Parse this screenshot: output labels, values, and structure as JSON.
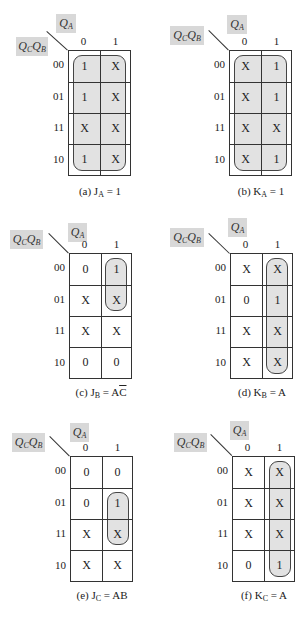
{
  "figure": {
    "col_var": "Q",
    "col_var_sub": "A",
    "row_var_1": "Q",
    "row_var_1_sub": "C",
    "row_var_2": "Q",
    "row_var_2_sub": "B",
    "col_headers": [
      "0",
      "1"
    ],
    "row_headers": [
      "00",
      "01",
      "11",
      "10"
    ]
  },
  "maps": [
    {
      "id": "a",
      "caption_prefix": "(a) J",
      "caption_sub": "A",
      "caption_eq": " = 1",
      "cells": [
        [
          "1",
          "X"
        ],
        [
          "1",
          "X"
        ],
        [
          "X",
          "X"
        ],
        [
          "1",
          "X"
        ]
      ],
      "group": {
        "col_start": 0,
        "col_end": 1,
        "row_start": 0,
        "row_end": 3
      }
    },
    {
      "id": "b",
      "caption_prefix": "(b) K",
      "caption_sub": "A",
      "caption_eq": " = 1",
      "cells": [
        [
          "X",
          "1"
        ],
        [
          "X",
          "1"
        ],
        [
          "X",
          "X"
        ],
        [
          "X",
          "1"
        ]
      ],
      "group": {
        "col_start": 0,
        "col_end": 1,
        "row_start": 0,
        "row_end": 3
      }
    },
    {
      "id": "c",
      "caption_prefix": "(c) J",
      "caption_sub": "B",
      "caption_eq": " = A",
      "caption_overbar": "C",
      "cells": [
        [
          "0",
          "1"
        ],
        [
          "X",
          "X"
        ],
        [
          "X",
          "X"
        ],
        [
          "0",
          "0"
        ]
      ],
      "group": {
        "col_start": 1,
        "col_end": 1,
        "row_start": 0,
        "row_end": 1
      }
    },
    {
      "id": "d",
      "caption_prefix": "(d) K",
      "caption_sub": "B",
      "caption_eq": " = A",
      "cells": [
        [
          "X",
          "X"
        ],
        [
          "0",
          "1"
        ],
        [
          "X",
          "X"
        ],
        [
          "X",
          "X"
        ]
      ],
      "group": {
        "col_start": 1,
        "col_end": 1,
        "row_start": 0,
        "row_end": 3
      }
    },
    {
      "id": "e",
      "caption_prefix": "(e) J",
      "caption_sub": "C",
      "caption_eq": " = AB",
      "cells": [
        [
          "0",
          "0"
        ],
        [
          "0",
          "1"
        ],
        [
          "X",
          "X"
        ],
        [
          "X",
          "X"
        ]
      ],
      "group": {
        "col_start": 1,
        "col_end": 1,
        "row_start": 1,
        "row_end": 2
      }
    },
    {
      "id": "f",
      "caption_prefix": "(f) K",
      "caption_sub": "C",
      "caption_eq": " = A",
      "cells": [
        [
          "X",
          "X"
        ],
        [
          "X",
          "X"
        ],
        [
          "X",
          "X"
        ],
        [
          "0",
          "1"
        ]
      ],
      "group": {
        "col_start": 1,
        "col_end": 1,
        "row_start": 0,
        "row_end": 3
      }
    }
  ]
}
